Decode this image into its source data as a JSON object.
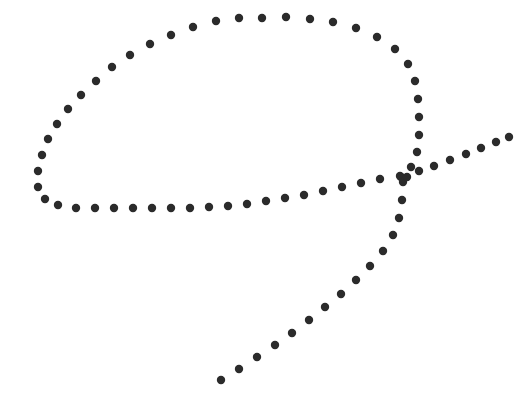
{
  "canvas": {
    "width": 519,
    "height": 407,
    "background_color": "#ffffff",
    "title": "dotted-stroke-drawing"
  },
  "style": {
    "dot_color": "#2b2b2b",
    "dot_radius": 4.2,
    "dot_shape": "circle"
  },
  "chart_data": {
    "type": "scatter",
    "title": "",
    "xlabel": "",
    "ylabel": "",
    "xlim": [
      0,
      519
    ],
    "ylim": [
      0,
      407
    ],
    "grid": false,
    "legend": "none",
    "series": [
      {
        "name": "loop-outline",
        "color": "#2b2b2b",
        "marker": "circle",
        "points": [
          [
            239,
            18
          ],
          [
            262,
            18
          ],
          [
            286,
            17
          ],
          [
            310,
            19
          ],
          [
            333,
            22
          ],
          [
            356,
            28
          ],
          [
            377,
            37
          ],
          [
            395,
            49
          ],
          [
            408,
            64
          ],
          [
            415,
            81
          ],
          [
            418,
            99
          ],
          [
            419,
            117
          ],
          [
            419,
            135
          ],
          [
            417,
            152
          ],
          [
            411,
            167
          ],
          [
            401,
            177
          ],
          [
            400,
            176
          ],
          [
            216,
            21
          ],
          [
            193,
            27
          ],
          [
            171,
            35
          ],
          [
            150,
            44
          ],
          [
            130,
            55
          ],
          [
            112,
            67
          ],
          [
            96,
            81
          ],
          [
            81,
            95
          ],
          [
            68,
            109
          ],
          [
            57,
            124
          ],
          [
            48,
            139
          ],
          [
            42,
            155
          ],
          [
            38,
            171
          ],
          [
            38,
            187
          ],
          [
            45,
            199
          ],
          [
            58,
            205
          ],
          [
            76,
            208
          ],
          [
            95,
            208
          ],
          [
            114,
            208
          ],
          [
            133,
            208
          ],
          [
            152,
            208
          ],
          [
            171,
            208
          ],
          [
            190,
            208
          ],
          [
            209,
            207
          ],
          [
            228,
            206
          ],
          [
            247,
            204
          ],
          [
            266,
            201
          ],
          [
            285,
            198
          ],
          [
            304,
            195
          ],
          [
            323,
            191
          ],
          [
            342,
            187
          ],
          [
            361,
            183
          ],
          [
            380,
            179
          ]
        ]
      },
      {
        "name": "diagonal-tail",
        "color": "#2b2b2b",
        "marker": "circle",
        "points": [
          [
            221,
            380
          ],
          [
            239,
            369
          ],
          [
            257,
            357
          ],
          [
            275,
            345
          ],
          [
            292,
            333
          ],
          [
            309,
            320
          ],
          [
            325,
            307
          ],
          [
            341,
            294
          ],
          [
            356,
            280
          ],
          [
            370,
            266
          ],
          [
            383,
            251
          ],
          [
            393,
            235
          ],
          [
            399,
            218
          ],
          [
            402,
            200
          ],
          [
            403,
            182
          ],
          [
            407,
            177
          ],
          [
            419,
            171
          ],
          [
            434,
            166
          ],
          [
            450,
            160
          ],
          [
            466,
            154
          ],
          [
            481,
            148
          ],
          [
            496,
            142
          ],
          [
            509,
            137
          ]
        ]
      }
    ]
  }
}
